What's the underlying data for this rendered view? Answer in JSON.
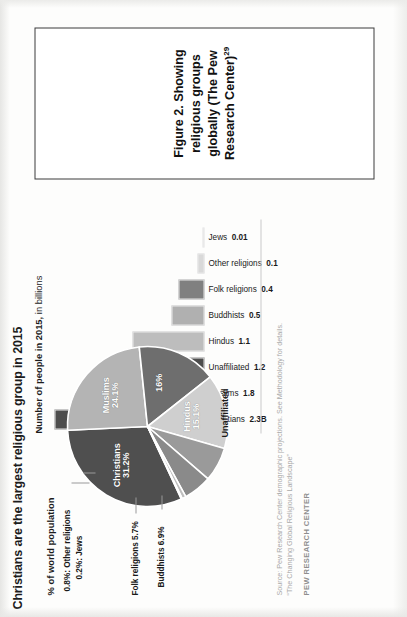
{
  "document": {
    "page_background": "#fbfbfa"
  },
  "infographic": {
    "title": "Christians are the largest religious group in 2015",
    "bar_section": {
      "heading_bold": "Number of people in 2015,",
      "heading_normal": " in billions"
    },
    "pie_section": {
      "heading": "% of world population"
    },
    "source": {
      "line1": "Source: Pew Research Center demographic projections. See Methodology for details.",
      "line2": "“The Changing Global Religious Landscape”",
      "brand": "PEW RESEARCH CENTER"
    },
    "callouts": [
      {
        "text": "0.8%: Other religions"
      },
      {
        "text": "0.2%: Jews"
      },
      {
        "text": "Folk religions 5.7%"
      },
      {
        "text": "Buddhists 6.9%"
      }
    ]
  },
  "caption": {
    "text": "Figure 2. Showing religious groups globally (The Pew Research Center)",
    "footnote_marker": "29"
  },
  "chart_data": [
    {
      "type": "bar",
      "title": "Number of people in 2015, in billions",
      "xlabel": "",
      "ylabel": "Billions of people",
      "ylim": [
        0,
        2.3
      ],
      "grid": false,
      "legend": "none",
      "categories": [
        "Christians",
        "Muslims",
        "Unaffiliated",
        "Hindus",
        "Buddhists",
        "Folk religions",
        "Other religions",
        "Jews"
      ],
      "values": [
        2.3,
        1.8,
        1.2,
        1.1,
        0.5,
        0.4,
        0.1,
        0.01
      ],
      "value_labels": [
        "2.3B",
        "1.8",
        "1.2",
        "1.1",
        "0.5",
        "0.4",
        "0.1",
        "0.01"
      ],
      "colors": [
        "#4d4d4d",
        "#a9a9a9",
        "#4d4d4d",
        "#bdbdbd",
        "#b0b0b0",
        "#808080",
        "#d9d9d9",
        "#ececec"
      ]
    },
    {
      "type": "pie",
      "title": "% of world population",
      "legend": "labels-on-slices",
      "labels": [
        "Christians",
        "Muslims",
        "Unaffiliated",
        "Hindus",
        "Buddhists",
        "Folk religions",
        "Other religions",
        "Jews"
      ],
      "values": [
        31.2,
        24.1,
        16.0,
        15.1,
        6.9,
        5.7,
        0.8,
        0.2
      ],
      "value_labels": [
        "31.2%",
        "24.1%",
        "16%",
        "15.1%",
        "6.9%",
        "5.7%",
        "0.8%",
        "0.2%"
      ],
      "colors": [
        "#4f4f4f",
        "#b4b4b4",
        "#6e6e6e",
        "#cfcfcf",
        "#9a9a9a",
        "#8a8a8a",
        "#bfbfbf",
        "#e2e2e2"
      ]
    }
  ]
}
